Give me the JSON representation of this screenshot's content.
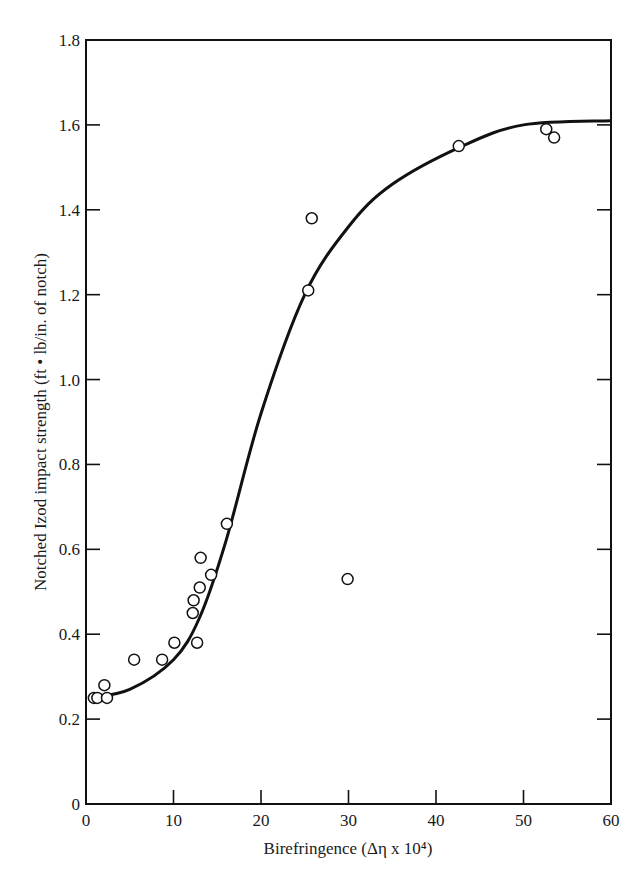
{
  "chart_data": {
    "type": "scatter",
    "title": "",
    "xlabel": "Birefringence (Δη x 10⁴)",
    "ylabel": "Notched Izod impact strength (ft • lb/in. of notch)",
    "xlim": [
      0,
      60
    ],
    "ylim": [
      0,
      1.8
    ],
    "grid": false,
    "legend": null,
    "x_ticks": [
      0,
      10,
      20,
      30,
      40,
      50,
      60
    ],
    "x_tick_labels": [
      "0",
      "10",
      "20",
      "30",
      "40",
      "50",
      "60"
    ],
    "y_ticks": [
      0,
      0.2,
      0.4,
      0.6,
      0.8,
      1.0,
      1.2,
      1.4,
      1.6,
      1.8
    ],
    "y_tick_labels": [
      "0",
      "0.2",
      "0.4",
      "0.6",
      "0.8",
      "1.0",
      "1.2",
      "1.4",
      "1.6",
      "1.8"
    ],
    "series": [
      {
        "name": "measured",
        "marker": "open-circle",
        "x": [
          0.9,
          1.3,
          2.1,
          2.4,
          5.5,
          8.7,
          10.1,
          12.2,
          12.3,
          12.7,
          13.0,
          13.1,
          14.3,
          16.1,
          25.4,
          25.8,
          29.9,
          42.6,
          52.6,
          53.5
        ],
        "y": [
          0.25,
          0.25,
          0.28,
          0.25,
          0.34,
          0.34,
          0.38,
          0.45,
          0.48,
          0.38,
          0.51,
          0.58,
          0.54,
          0.66,
          1.21,
          1.38,
          0.53,
          1.55,
          1.59,
          1.57
        ]
      },
      {
        "name": "fitted curve",
        "style": "solid-line",
        "x": [
          0.5,
          5,
          10,
          13,
          16,
          20,
          25,
          30,
          35,
          43,
          50,
          60
        ],
        "y": [
          0.25,
          0.27,
          0.34,
          0.44,
          0.62,
          0.92,
          1.2,
          1.36,
          1.46,
          1.55,
          1.6,
          1.61
        ]
      }
    ]
  }
}
